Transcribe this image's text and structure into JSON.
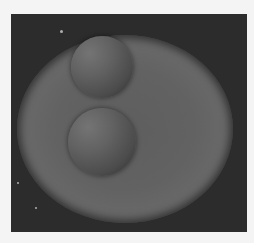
{
  "image": {
    "description": "Grayscale rendering of two spheres resting on a large shaded elliptical disk against a dark background",
    "colors": {
      "page_background": "#f4f4f4",
      "frame_background": "#2c2c2c",
      "disk_mid": "#626262",
      "sphere_highlight": "#747474",
      "sphere_shadow": "#2e2e2e"
    },
    "objects": [
      {
        "name": "large-elliptical-disk"
      },
      {
        "name": "upper-sphere"
      },
      {
        "name": "lower-sphere"
      }
    ]
  }
}
